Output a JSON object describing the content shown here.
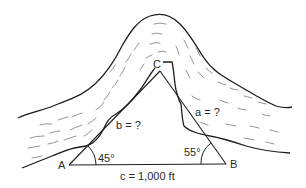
{
  "diagram": {
    "type": "triangle-over-river",
    "vertices": {
      "A": {
        "label": "A",
        "x": 69,
        "y": 165
      },
      "B": {
        "label": "B",
        "x": 226,
        "y": 164
      },
      "C": {
        "label": "C",
        "x": 160,
        "y": 71
      }
    },
    "angles": {
      "A": "45°",
      "B": "55°"
    },
    "sides": {
      "a": "a = ?",
      "b": "b = ?",
      "c": "c = 1,000 ft"
    },
    "colors": {
      "line": "#1e1e1e",
      "hatch": "#8a8a8a",
      "background": "#ffffff"
    }
  }
}
